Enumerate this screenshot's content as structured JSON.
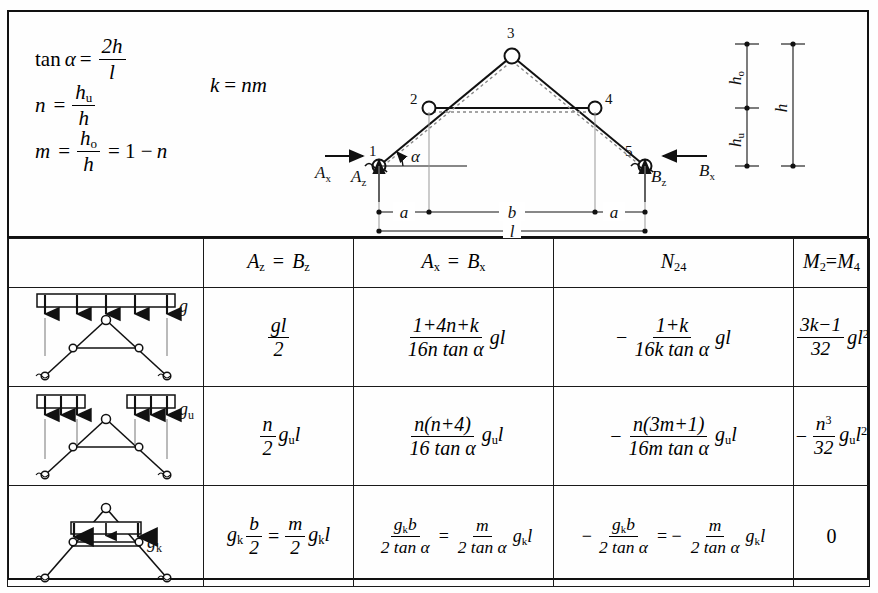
{
  "header": {
    "formulas": [
      {
        "id": "tan-alpha",
        "lhs": "tan α =",
        "num": "2h",
        "den": "l"
      },
      {
        "id": "n-def",
        "lhs": "n =",
        "num": "h_u",
        "den": "h"
      },
      {
        "id": "m-def",
        "lhs": "m =",
        "num": "h_o",
        "den": "h",
        "tail": "= 1 − n"
      }
    ],
    "k_definition": "k = nm",
    "tan_lhs": "tan",
    "alpha_symbol": "α",
    "equals": "=",
    "tan_num": "2h",
    "tan_den": "l",
    "n_lhs": "n",
    "n_num_base": "h",
    "n_num_sub": "u",
    "n_den": "h",
    "m_lhs": "m",
    "m_num_base": "h",
    "m_num_sub": "o",
    "m_den": "h",
    "m_tail": "= 1 −",
    "m_tail_var": "n",
    "k_lhs": "k",
    "k_rhs": "nm"
  },
  "diagram": {
    "nodes": [
      {
        "label": "1",
        "x": 72,
        "y": 148
      },
      {
        "label": "2",
        "x": 122,
        "y": 90
      },
      {
        "label": "3",
        "x": 205,
        "y": 38
      },
      {
        "label": "4",
        "x": 288,
        "y": 90
      },
      {
        "label": "5",
        "x": 338,
        "y": 148
      }
    ],
    "node_labels": [
      "1",
      "2",
      "3",
      "4",
      "5"
    ],
    "reactions": {
      "ax": "A",
      "ax_sub": "x",
      "az": "A",
      "az_sub": "z",
      "bx": "B",
      "bx_sub": "x",
      "bz": "B",
      "bz_sub": "z"
    },
    "angle_label": "α",
    "dimensions": {
      "a_left": "a",
      "b": "b",
      "a_right": "a",
      "l": "l",
      "h_o": "h",
      "h_o_sub": "o",
      "h_u": "h",
      "h_u_sub": "u",
      "h": "h"
    }
  },
  "table": {
    "columns": [
      {
        "id": "load-case",
        "label": ""
      },
      {
        "id": "az-bz",
        "base_a": "A",
        "sub_a": "z",
        "eq": "=",
        "base_b": "B",
        "sub_b": "z"
      },
      {
        "id": "ax-bx",
        "base_a": "A",
        "sub_a": "x",
        "eq": "=",
        "base_b": "B",
        "sub_b": "x"
      },
      {
        "id": "n24",
        "base_a": "N",
        "sub_a": "24"
      },
      {
        "id": "m2-m4",
        "base_a": "M",
        "sub_a": "2",
        "eq": "=",
        "base_b": "M",
        "sub_b": "4"
      }
    ],
    "rows": [
      {
        "id": "row-g",
        "load_label": "g",
        "load_type": "full-span",
        "az_bz": {
          "num": "gl",
          "den": "2"
        },
        "ax_bx": {
          "num": "1+4n+k",
          "den": "16n tan α",
          "suffix": "gl"
        },
        "n24": {
          "sign": "−",
          "num": "1+k",
          "den": "16k tan α",
          "suffix": "gl"
        },
        "m2_m4": {
          "num": "3k−1",
          "den": "32",
          "suffix": "gl",
          "suffix_sup": "2"
        }
      },
      {
        "id": "row-gu",
        "load_label": "g",
        "load_sub": "u",
        "load_type": "outer-spans",
        "az_bz": {
          "num": "n",
          "den": "2",
          "suffix": "g",
          "suffix_sub": "u",
          "suffix_tail": "l"
        },
        "ax_bx": {
          "num": "n(n+4)",
          "den": "16 tan α",
          "suffix": "g",
          "suffix_sub": "u",
          "suffix_tail": "l"
        },
        "n24": {
          "sign": "−",
          "num": "n(3m+1)",
          "den": "16m tan α",
          "suffix": "g",
          "suffix_sub": "u",
          "suffix_tail": "l"
        },
        "m2_m4": {
          "sign": "−",
          "num": "n",
          "num_sup": "3",
          "den": "32",
          "suffix": "g",
          "suffix_sub": "u",
          "suffix_tail": "l",
          "suffix_sup": "2"
        }
      },
      {
        "id": "row-gk",
        "load_label": "g",
        "load_sub": "k",
        "load_type": "middle-span",
        "az_bz": {
          "prefix": "g",
          "prefix_sub": "k",
          "num": "b",
          "den": "2",
          "eq": "=",
          "num2": "m",
          "den2": "2",
          "suffix": "g",
          "suffix_sub": "k",
          "suffix_tail": "l"
        },
        "ax_bx": {
          "num": "g_k b",
          "den": "2 tan α",
          "eq": "=",
          "num2": "m",
          "den2": "2 tan α",
          "suffix": "g",
          "suffix_sub": "k",
          "suffix_tail": "l"
        },
        "n24": {
          "sign": "−",
          "num": "g_k b",
          "den": "2 tan α",
          "eq": "= −",
          "num2": "m",
          "den2": "2 tan α",
          "suffix": "g",
          "suffix_sub": "k",
          "suffix_tail": "l"
        },
        "m2_m4": {
          "value": "0"
        }
      }
    ]
  },
  "symbols": {
    "g": "g",
    "l": "l",
    "b": "b",
    "k": "k",
    "m": "m",
    "n": "n",
    "tan": "tan",
    "alpha": "α",
    "zero": "0"
  },
  "colors": {
    "ink": "#111111",
    "paper": "#ffffff",
    "rule": "#1a1a1a"
  }
}
